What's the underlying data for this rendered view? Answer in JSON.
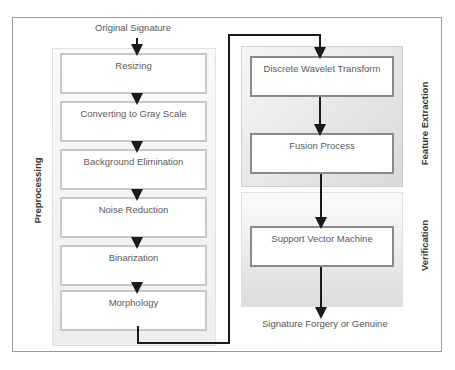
{
  "diagram": {
    "input_label": "Original Signature",
    "output_label": "Signature Forgery or Genuine",
    "sections": [
      {
        "name": "Preprocessing",
        "steps": [
          "Resizing",
          "Converting to Gray Scale",
          "Background Elimination",
          "Noise Reduction",
          "Binarization",
          "Morphology"
        ]
      },
      {
        "name": "Feature Extraction",
        "steps": [
          "Discrete Wavelet Transform",
          "Fusion Process"
        ]
      },
      {
        "name": "Verification",
        "steps": [
          "Support Vector Machine"
        ]
      }
    ]
  },
  "colors": {
    "frame_border": "#9a9a9a",
    "arrow": "#1a1a1a",
    "box_border_pre": "#c8c8c8",
    "box_border_right": "#8a8a8a"
  }
}
